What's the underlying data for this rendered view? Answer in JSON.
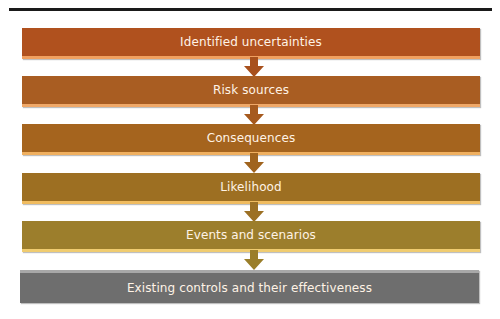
{
  "diagram": {
    "title": "",
    "boxes": [
      {
        "label": "Identified uncertainties",
        "color": "#b0511e",
        "accent": "#f0a060"
      },
      {
        "label": "Risk sources",
        "color": "#a95d22",
        "accent": "#f0a868"
      },
      {
        "label": "Consequences",
        "color": "#a5641e",
        "accent": "#f0b060"
      },
      {
        "label": "Likelihood",
        "color": "#9d6f22",
        "accent": "#f0bc60"
      },
      {
        "label": "Events and scenarios",
        "color": "#9c7e2c",
        "accent": "#f0cc70"
      },
      {
        "label": "Existing controls and their effectiveness",
        "color": "#6e6e6e",
        "accent": "#a8a8a8"
      }
    ],
    "arrows": [
      {
        "from": 0,
        "to": 1,
        "color": "#a8501c"
      },
      {
        "from": 1,
        "to": 2,
        "color": "#a65a1e"
      },
      {
        "from": 2,
        "to": 3,
        "color": "#a0641e"
      },
      {
        "from": 3,
        "to": 4,
        "color": "#9c7024"
      },
      {
        "from": 4,
        "to": 5,
        "color": "#9a7e2a"
      }
    ]
  }
}
